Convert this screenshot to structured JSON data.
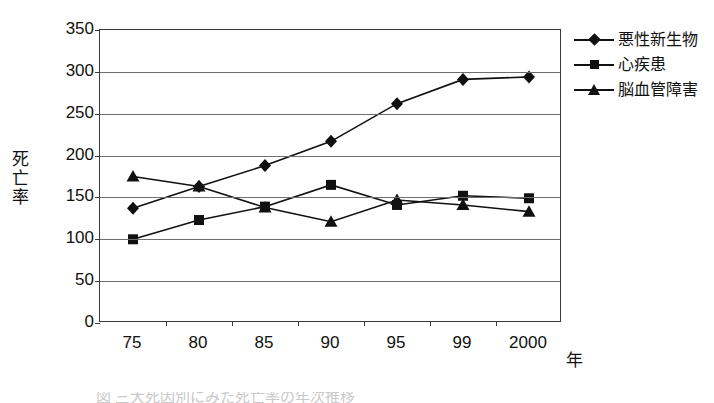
{
  "chart_data": {
    "type": "line",
    "title": "",
    "xlabel": "年",
    "ylabel": "死亡率",
    "categories": [
      "75",
      "80",
      "85",
      "90",
      "95",
      "99",
      "2000"
    ],
    "ylim": [
      0,
      350
    ],
    "yticks": [
      0,
      50,
      100,
      150,
      200,
      250,
      300,
      350
    ],
    "grid": true,
    "legend_position": "right",
    "series": [
      {
        "name": "悪性新生物",
        "marker": "diamond",
        "color": "#111111",
        "values": [
          137,
          163,
          188,
          217,
          262,
          291,
          294
        ]
      },
      {
        "name": "心疾患",
        "marker": "square",
        "color": "#111111",
        "values": [
          100,
          123,
          139,
          165,
          141,
          152,
          149
        ]
      },
      {
        "name": "脳血管障害",
        "marker": "triangle",
        "color": "#111111",
        "values": [
          175,
          163,
          138,
          121,
          147,
          141,
          133
        ]
      }
    ]
  },
  "axes": {
    "y_title": "死亡率",
    "x_title": "年",
    "y_tick_labels": [
      "350",
      "300",
      "250",
      "200",
      "150",
      "100",
      "50",
      "0"
    ],
    "x_tick_labels": [
      "75",
      "80",
      "85",
      "90",
      "95",
      "99",
      "2000"
    ]
  },
  "legend": {
    "items": [
      {
        "label": "悪性新生物",
        "marker": "diamond"
      },
      {
        "label": "心疾患",
        "marker": "square"
      },
      {
        "label": "脳血管障害",
        "marker": "triangle"
      }
    ]
  },
  "caption": {
    "text": "図  三大死因別にみた死亡率の年次推移"
  }
}
